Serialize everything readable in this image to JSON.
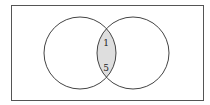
{
  "diagram": {
    "type": "venn",
    "sets": [
      {
        "name": "A",
        "position": "left"
      },
      {
        "name": "B",
        "position": "right"
      }
    ],
    "intersection": {
      "shaded": true,
      "fill": "#dedede",
      "values": [
        "1",
        "5"
      ]
    },
    "stroke": "#444444",
    "frame_stroke": "#555555"
  }
}
